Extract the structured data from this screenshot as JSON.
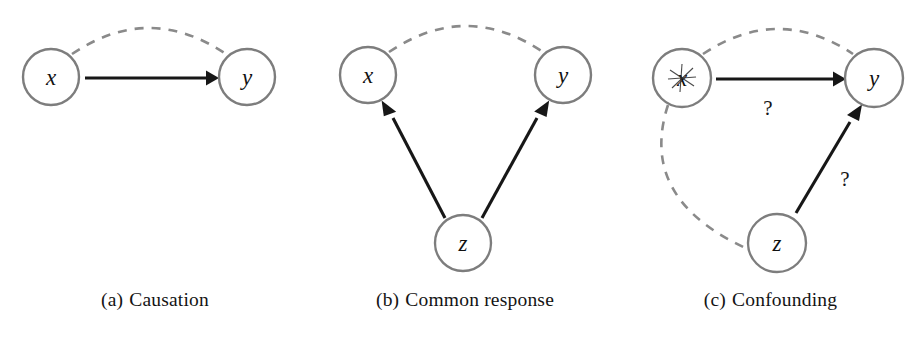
{
  "figure": {
    "background_color": "#ffffff",
    "node_stroke_color": "#7d7d7d",
    "dashed_edge_color": "#8a8a8a",
    "solid_edge_color": "#171717",
    "caption_color": "#141414"
  },
  "panels": [
    {
      "id": "panel-a",
      "caption_tag": "(a)",
      "caption_text": "Causation",
      "nodes": [
        {
          "id": "x",
          "label": "x",
          "cx": 51,
          "cy": 77,
          "r": 28
        },
        {
          "id": "y",
          "label": "y",
          "cx": 247,
          "cy": 77,
          "r": 28
        }
      ],
      "edges": [
        {
          "from": "x",
          "to": "y",
          "style": "solid",
          "arrow": true,
          "label": ""
        },
        {
          "from": "x",
          "to": "y",
          "style": "dashed",
          "arrow": false,
          "label": "",
          "position": "above"
        }
      ]
    },
    {
      "id": "panel-b",
      "caption_tag": "(b)",
      "caption_text": "Common response",
      "nodes": [
        {
          "id": "x",
          "label": "x",
          "cx": 368,
          "cy": 75,
          "r": 28
        },
        {
          "id": "y",
          "label": "y",
          "cx": 563,
          "cy": 75,
          "r": 28
        },
        {
          "id": "z",
          "label": "z",
          "cx": 463,
          "cy": 243,
          "r": 28
        }
      ],
      "edges": [
        {
          "from": "z",
          "to": "x",
          "style": "solid",
          "arrow": true,
          "label": ""
        },
        {
          "from": "z",
          "to": "y",
          "style": "solid",
          "arrow": true,
          "label": ""
        },
        {
          "from": "x",
          "to": "y",
          "style": "dashed",
          "arrow": false,
          "label": "",
          "position": "above"
        }
      ]
    },
    {
      "id": "panel-c",
      "caption_tag": "(c)",
      "caption_text": "Confounding",
      "nodes": [
        {
          "id": "x",
          "label": "x",
          "cx": 682,
          "cy": 78,
          "r": 29
        },
        {
          "id": "y",
          "label": "y",
          "cx": 874,
          "cy": 78,
          "r": 29
        },
        {
          "id": "z",
          "label": "z",
          "cx": 777,
          "cy": 243,
          "r": 29
        }
      ],
      "edges": [
        {
          "from": "x",
          "to": "y",
          "style": "solid",
          "arrow": true,
          "label": "?",
          "label_x": 768,
          "label_y": 115
        },
        {
          "from": "z",
          "to": "y",
          "style": "solid",
          "arrow": true,
          "label": "?",
          "label_x": 845,
          "label_y": 186
        },
        {
          "from": "x",
          "to": "y",
          "style": "dashed",
          "arrow": false,
          "label": "",
          "position": "above"
        },
        {
          "from": "x",
          "to": "z",
          "style": "dashed",
          "arrow": false,
          "label": "",
          "position": "left"
        }
      ]
    }
  ]
}
